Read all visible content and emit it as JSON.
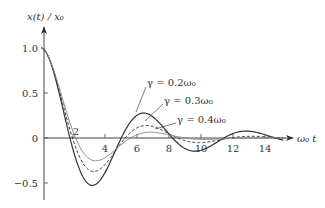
{
  "chart_data": {
    "type": "line",
    "title": "",
    "xlabel": "ω₀ t",
    "ylabel": "x(t) / x₀",
    "xlim": [
      0,
      15.5
    ],
    "ylim": [
      -0.7,
      1.2
    ],
    "grid": false,
    "legend_position": "inline annotations",
    "x_ticks": [
      2,
      4,
      6,
      8,
      10,
      12,
      14
    ],
    "x_tick_labels": [
      "2",
      "4",
      "6",
      "8",
      "10",
      "12",
      "14"
    ],
    "y_ticks": [
      1.0,
      0.5,
      0,
      -0.5
    ],
    "y_tick_labels": [
      "1.0",
      "0.5",
      "0",
      "−0.5"
    ],
    "series": [
      {
        "name": "γ = 0.2ω₀",
        "gamma": 0.2,
        "style": "solid",
        "color": "#333333",
        "width": 1.2,
        "x": [
          0,
          1.8,
          3.3,
          4.9,
          6.4,
          8.0,
          9.6,
          11.2,
          12.8,
          14.4
        ],
        "values": [
          1.0,
          0.0,
          -0.52,
          0.0,
          0.28,
          0.0,
          -0.15,
          0.0,
          0.08,
          0.0
        ]
      },
      {
        "name": "γ = 0.3ω₀",
        "gamma": 0.3,
        "style": "dashed",
        "color": "#333333",
        "width": 1.0,
        "x": [
          0,
          1.8,
          3.3,
          4.9,
          6.4,
          8.0,
          9.6,
          11.2,
          12.8,
          14.4
        ],
        "values": [
          1.0,
          0.0,
          -0.38,
          0.0,
          0.15,
          0.0,
          -0.06,
          0.0,
          0.02,
          0.0
        ]
      },
      {
        "name": "γ = 0.4ω₀",
        "gamma": 0.4,
        "style": "solid-light",
        "color": "#888888",
        "width": 1.0,
        "x": [
          0,
          1.8,
          3.3,
          4.9,
          6.4,
          8.0,
          9.6,
          11.2,
          12.8,
          14.4
        ],
        "values": [
          1.0,
          0.0,
          -0.28,
          0.0,
          0.08,
          0.0,
          -0.02,
          0.0,
          0.01,
          0.0
        ]
      }
    ],
    "annotations": [
      {
        "text": "γ = 0.2ω₀",
        "points_to": "γ = 0.2ω₀ curve near first positive peak"
      },
      {
        "text": "γ = 0.3ω₀",
        "points_to": "γ = 0.3ω₀ curve near first positive peak"
      },
      {
        "text": "γ = 0.4ω₀",
        "points_to": "γ = 0.4ω₀ curve near first positive peak"
      }
    ]
  },
  "labels": {
    "y_axis": "x(t) / x₀",
    "x_axis": "ω₀ t",
    "origin_x_tick": "2",
    "ann_02": "γ = 0.2ω₀",
    "ann_03": "γ = 0.3ω₀",
    "ann_04": "γ = 0.4ω₀"
  }
}
